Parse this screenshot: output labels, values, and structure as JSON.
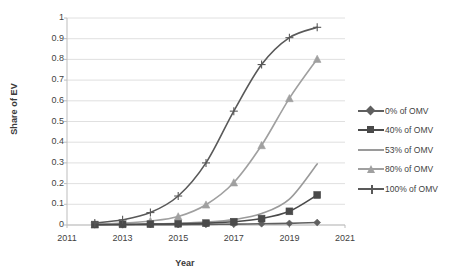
{
  "chart_data": {
    "type": "line",
    "title": "",
    "xlabel": "Year",
    "ylabel": "Share of EV",
    "xlim": [
      2011,
      2021
    ],
    "ylim": [
      0,
      1
    ],
    "ytick_step": 0.1,
    "xtick_step": 2,
    "grid": "horizontal",
    "legend_position": "right",
    "xticks": [
      "2011",
      "2013",
      "2015",
      "2017",
      "2019",
      "2021"
    ],
    "yticks": [
      "0",
      "0.1",
      "0.2",
      "0.3",
      "0.4",
      "0.5",
      "0.6",
      "0.7",
      "0.8",
      "0.9",
      "1"
    ],
    "x": [
      2012,
      2013,
      2014,
      2015,
      2016,
      2017,
      2018,
      2019,
      2020
    ],
    "series": [
      {
        "name": "0% of OMV",
        "marker": "diamond",
        "color": "#5f5f5f",
        "values": [
          0.001,
          0.001,
          0.002,
          0.002,
          0.003,
          0.004,
          0.006,
          0.008,
          0.012
        ]
      },
      {
        "name": "40% of OMV",
        "marker": "square",
        "color": "#4a4a4a",
        "values": [
          0.002,
          0.003,
          0.004,
          0.006,
          0.009,
          0.016,
          0.031,
          0.066,
          0.145
        ]
      },
      {
        "name": "53% of OMV",
        "marker": "none",
        "color": "#9a9a9a",
        "values": [
          0.002,
          0.003,
          0.005,
          0.008,
          0.014,
          0.026,
          0.055,
          0.125,
          0.295
        ]
      },
      {
        "name": "80% of OMV",
        "marker": "triangle",
        "color": "#a0a0a0",
        "values": [
          0.004,
          0.009,
          0.019,
          0.041,
          0.098,
          0.205,
          0.385,
          0.612,
          0.802
        ]
      },
      {
        "name": "100% of OMV",
        "marker": "plus",
        "color": "#595959",
        "values": [
          0.01,
          0.025,
          0.06,
          0.14,
          0.3,
          0.55,
          0.775,
          0.905,
          0.955
        ]
      }
    ]
  },
  "legend": {
    "items": [
      {
        "label": "0% of OMV"
      },
      {
        "label": "40% of OMV"
      },
      {
        "label": "53% of OMV"
      },
      {
        "label": "80% of OMV"
      },
      {
        "label": "100% of OMV"
      }
    ]
  },
  "axes": {
    "x_title": "Year",
    "y_title": "Share of EV"
  },
  "colors": {
    "grid": "#d8d8d8",
    "axis": "#bdbdbd",
    "text": "#3f3f3f",
    "background": "#ffffff"
  }
}
